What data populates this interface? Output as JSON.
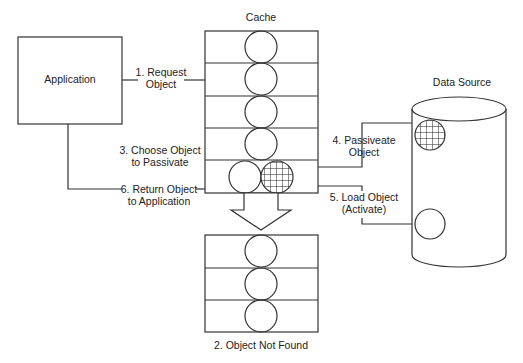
{
  "diagram": {
    "application": {
      "label": "Application"
    },
    "cache": {
      "title": "Cache",
      "slots": 5
    },
    "not_found_cache": {
      "slots": 3,
      "caption": "2. Object Not Found"
    },
    "data_source": {
      "title": "Data  Source"
    },
    "steps": {
      "s1": [
        "1. Request",
        "Object"
      ],
      "s3": [
        "3. Choose Object",
        "to Passivate"
      ],
      "s4": [
        "4. Passiveate",
        "Object"
      ],
      "s5": [
        "5. Load Object",
        "(Activate)"
      ],
      "s6": [
        "6. Return Object",
        "to Application"
      ]
    }
  }
}
